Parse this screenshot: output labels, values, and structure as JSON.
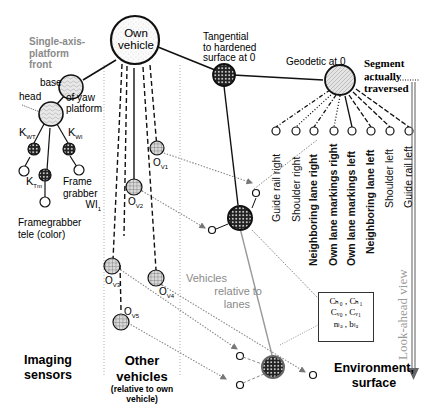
{
  "nodes": {
    "own_vehicle": "Own vehicle",
    "own_vehicle_l1": "Own",
    "own_vehicle_l2": "vehicle",
    "tangential": [
      "Tangential",
      "to hardened",
      "surface at 0"
    ],
    "geodetic": "Geodetic at 0",
    "segment": [
      "Segment",
      "actually",
      "traversed"
    ],
    "platform_title": [
      "Single-axis-",
      "platform",
      "front"
    ],
    "base": "base",
    "head": "head",
    "yaw": [
      "of yaw",
      "platform"
    ],
    "k_wr": {
      "main": "K",
      "sub": "WT"
    },
    "k_wl": {
      "main": "K",
      "sub": "Wl"
    },
    "k_tm": {
      "main": "K",
      "sub": "Tm"
    },
    "frame_grabber": [
      "Frame",
      "grabber",
      "WI"
    ],
    "frame_grabber_sub": "1",
    "framegrabber_tele": [
      "Framegrabber",
      "tele (color)"
    ],
    "vehicles": [
      {
        "main": "O",
        "sub": "V1"
      },
      {
        "main": "O",
        "sub": "V2"
      },
      {
        "main": "O",
        "sub": "V3"
      },
      {
        "main": "O",
        "sub": "V4"
      },
      {
        "main": "O",
        "sub": "V5"
      }
    ],
    "vehicles_relative": [
      "Vehicles",
      "relative to",
      "lanes"
    ],
    "lane_labels": [
      {
        "text": "Guide rail right",
        "bold": false
      },
      {
        "text": "Shoulder right",
        "bold": false
      },
      {
        "text": "Neighboring lane right",
        "bold": true
      },
      {
        "text": "Own lane markings right",
        "bold": true
      },
      {
        "text": "Own lane markings left",
        "bold": true
      },
      {
        "text": "Neighboring lane left",
        "bold": true
      },
      {
        "text": "Shoulder  left",
        "bold": false
      },
      {
        "text": "Guide rail left",
        "bold": false
      }
    ],
    "lookahead": "Look-ahead view",
    "params": [
      "Cₕ₀ , Cₕ₁",
      "Cᵥ₀ , Cᵥ₁",
      "nₗₐ , bₗₐ"
    ]
  },
  "sections": {
    "imaging": [
      "Imaging",
      "sensors"
    ],
    "other": [
      "Other",
      "vehicles"
    ],
    "other_sub": [
      "(relative to own",
      "vehicle)"
    ],
    "environment": [
      "Environment,",
      "surface"
    ]
  },
  "colors": {
    "stroke": "#111111",
    "gray_line": "#8c8c8c",
    "gray_text": "#8a8a8a",
    "node_fill": "#e6e6e6"
  }
}
